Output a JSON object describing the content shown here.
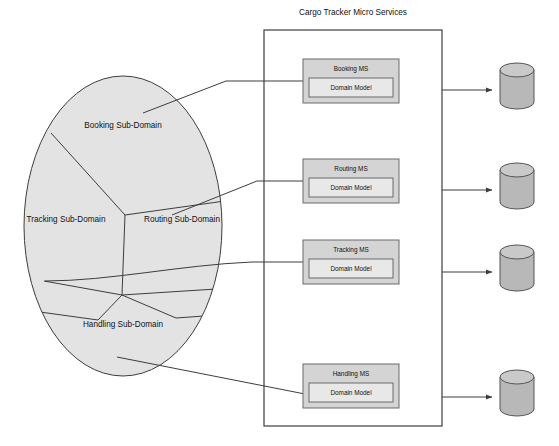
{
  "diagram": {
    "title": "Cargo Tracker Micro Services",
    "background_color": "#ffffff",
    "stroke_color": "#3d3d3d",
    "domain_fill": "#e3e3e3",
    "service_header_fill": "#d4d4d4",
    "service_body_fill": "#e8e8e8",
    "database_fill": "#b8b8b8",
    "database_top_fill": "#c9c9c9"
  },
  "domain_ellipse": {
    "name": "Cargo Tracker Domain",
    "subdomains": [
      {
        "id": "booking",
        "label": "Booking Sub-Domain"
      },
      {
        "id": "tracking",
        "label": "Tracking Sub-Domain"
      },
      {
        "id": "routing",
        "label": "Routing Sub-Domain"
      },
      {
        "id": "handling",
        "label": "Handling Sub-Domain"
      }
    ]
  },
  "container": {
    "label": "Cargo Tracker Micro Services",
    "services": [
      {
        "id": "booking",
        "name": "Booking MS",
        "inner": "Domain Model"
      },
      {
        "id": "routing",
        "name": "Routing MS",
        "inner": "Domain Model"
      },
      {
        "id": "tracking",
        "name": "Tracking MS",
        "inner": "Domain Model"
      },
      {
        "id": "handling",
        "name": "Handling MS",
        "inner": "Domain Model"
      }
    ]
  },
  "databases": [
    {
      "id": "db-booking",
      "name": "database-cylinder"
    },
    {
      "id": "db-routing",
      "name": "database-cylinder"
    },
    {
      "id": "db-tracking",
      "name": "database-cylinder"
    },
    {
      "id": "db-handling",
      "name": "database-cylinder"
    }
  ],
  "connectors": {
    "subdomain_to_service": [
      {
        "from": "booking",
        "to": "booking-ms"
      },
      {
        "from": "routing",
        "to": "routing-ms"
      },
      {
        "from": "tracking",
        "to": "tracking-ms"
      },
      {
        "from": "handling",
        "to": "handling-ms"
      }
    ],
    "service_to_database": [
      {
        "from": "booking-ms",
        "to": "db-booking"
      },
      {
        "from": "routing-ms",
        "to": "db-routing"
      },
      {
        "from": "tracking-ms",
        "to": "db-tracking"
      },
      {
        "from": "handling-ms",
        "to": "db-handling"
      }
    ]
  }
}
